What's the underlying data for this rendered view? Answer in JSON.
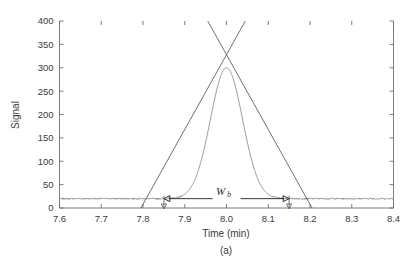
{
  "figure": {
    "caption": "(a)",
    "background_color": "#ffffff"
  },
  "chart_data": {
    "type": "line",
    "title": "",
    "xlabel": "Time (min)",
    "ylabel": "Signal",
    "xlim": [
      7.6,
      8.4
    ],
    "ylim": [
      0,
      400
    ],
    "xticks": [
      7.6,
      7.7,
      7.8,
      7.9,
      8.0,
      8.1,
      8.2,
      8.3,
      8.4
    ],
    "xtick_labels": [
      "7.6",
      "7.7",
      "7.8",
      "7.9",
      "8.0",
      "8.1",
      "8.2",
      "8.3",
      "8.4"
    ],
    "yticks": [
      0,
      50,
      100,
      150,
      200,
      250,
      300,
      350,
      400
    ],
    "ytick_labels": [
      "0",
      "50",
      "100",
      "150",
      "200",
      "250",
      "300",
      "350",
      "400"
    ],
    "grid": false,
    "legend": null,
    "series": [
      {
        "name": "chromatogram-peak",
        "kind": "gaussian-peak",
        "color": "#8d8d8d",
        "baseline": 20,
        "peak_height": 280,
        "peak_apex_signal": 300,
        "peak_center_time": 8.0,
        "peak_sigma_min": 0.0385,
        "noise_amplitude": 1.6
      },
      {
        "name": "left-inflection-tangent",
        "kind": "line",
        "color": "#555555",
        "x": [
          7.795,
          8.045
        ],
        "y": [
          0,
          400
        ]
      },
      {
        "name": "right-inflection-tangent",
        "kind": "line",
        "color": "#555555",
        "x": [
          8.205,
          7.955
        ],
        "y": [
          0,
          400
        ]
      }
    ],
    "annotations": [
      {
        "name": "peak-width-at-base",
        "label": "W",
        "label_subscript": "b",
        "kind": "double-arrow",
        "y_signal": 20,
        "x_start": 7.85,
        "x_end": 8.15,
        "value": 0.3,
        "value_units": "min"
      },
      {
        "name": "left-baseline-intercept-drop",
        "kind": "down-arrow",
        "x": 7.85,
        "y_from": 20,
        "y_to": 0
      },
      {
        "name": "right-baseline-intercept-drop",
        "kind": "down-arrow",
        "x": 8.15,
        "y_from": 20,
        "y_to": 0
      }
    ]
  }
}
